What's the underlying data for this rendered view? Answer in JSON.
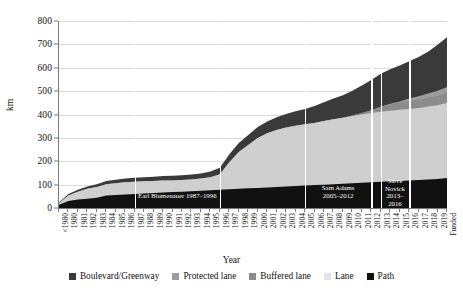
{
  "chart_data": {
    "type": "area",
    "stacked": true,
    "title": "",
    "xlabel": "Year",
    "ylabel": "km",
    "ylim": [
      0,
      800
    ],
    "yticks": [
      0,
      100,
      200,
      300,
      400,
      500,
      600,
      700,
      800
    ],
    "grid": true,
    "legend_position": "bottom",
    "categories": [
      "<1980",
      "1980",
      "1981",
      "1982",
      "1983",
      "1984",
      "1985",
      "1986",
      "1987",
      "1988",
      "1989",
      "1990",
      "1991",
      "1992",
      "1993",
      "1994",
      "1995",
      "1996",
      "1997",
      "1998",
      "1999",
      "2000",
      "2001",
      "2002",
      "2003",
      "2004",
      "2005",
      "2006",
      "2007",
      "2008",
      "2009",
      "2010",
      "2011",
      "2012",
      "2013",
      "2014",
      "2015",
      "2016",
      "2017",
      "2018",
      "2019",
      "Funded"
    ],
    "series": [
      {
        "name": "Path",
        "color": "#111111",
        "values": [
          14,
          30,
          36,
          40,
          44,
          54,
          56,
          58,
          60,
          62,
          64,
          66,
          68,
          70,
          72,
          74,
          76,
          78,
          80,
          82,
          84,
          86,
          88,
          90,
          92,
          94,
          96,
          98,
          100,
          102,
          104,
          106,
          108,
          110,
          112,
          114,
          116,
          118,
          120,
          122,
          124,
          128
        ]
      },
      {
        "name": "Lane",
        "color": "#cfcfcf",
        "values": [
          6,
          24,
          34,
          42,
          46,
          48,
          50,
          52,
          52,
          52,
          52,
          52,
          50,
          50,
          50,
          52,
          56,
          66,
          116,
          158,
          186,
          214,
          232,
          244,
          252,
          258,
          262,
          266,
          272,
          278,
          282,
          288,
          292,
          296,
          300,
          302,
          304,
          306,
          308,
          312,
          316,
          322
        ]
      },
      {
        "name": "Buffered lane",
        "color": "#8c8c8c",
        "values": [
          0,
          0,
          0,
          0,
          0,
          0,
          0,
          0,
          0,
          0,
          0,
          0,
          0,
          0,
          0,
          0,
          0,
          0,
          0,
          0,
          0,
          0,
          0,
          0,
          0,
          0,
          0,
          0,
          0,
          0,
          0,
          2,
          6,
          12,
          20,
          26,
          30,
          34,
          36,
          38,
          40,
          42
        ]
      },
      {
        "name": "Protected lane",
        "color": "#9c9c9c",
        "values": [
          0,
          0,
          0,
          0,
          0,
          0,
          0,
          0,
          0,
          0,
          0,
          0,
          0,
          0,
          0,
          0,
          0,
          0,
          0,
          0,
          0,
          0,
          0,
          0,
          0,
          0,
          0,
          0,
          0,
          0,
          0,
          0,
          0,
          0,
          2,
          4,
          6,
          10,
          14,
          18,
          22,
          26
        ]
      },
      {
        "name": "Boulevard/Greenway",
        "color": "#3a3a3a",
        "values": [
          4,
          6,
          8,
          10,
          12,
          14,
          15,
          16,
          17,
          18,
          18,
          19,
          20,
          20,
          21,
          22,
          24,
          28,
          34,
          38,
          42,
          46,
          50,
          54,
          58,
          62,
          66,
          72,
          80,
          88,
          96,
          106,
          118,
          130,
          140,
          148,
          154,
          160,
          168,
          178,
          196,
          212
        ]
      }
    ],
    "annotations": [
      {
        "label": "Earl Blumenauer 1987–1996",
        "start": "1987",
        "end": "1996",
        "orientation": "horizontal"
      },
      {
        "label": "Sam Adams\n2005–2012",
        "start": "2005",
        "end": "2012",
        "orientation": "block"
      },
      {
        "label": "Steve\nNovick\n2013–2016",
        "start": "2013",
        "end": "2016",
        "orientation": "block"
      }
    ],
    "vertical_lines": [
      "1987",
      "1996",
      "2005",
      "2012",
      "2013",
      "2016"
    ]
  },
  "legend": {
    "items": [
      {
        "label": "Boulevard/Greenway",
        "color": "#3a3a3a"
      },
      {
        "label": "Protected lane",
        "color": "#9c9c9c"
      },
      {
        "label": "Buffered lane",
        "color": "#8c8c8c"
      },
      {
        "label": "Lane",
        "color": "#e3e3e3"
      },
      {
        "label": "Path",
        "color": "#111111"
      }
    ]
  },
  "axes": {
    "y_title": "km",
    "x_title": "Year"
  }
}
